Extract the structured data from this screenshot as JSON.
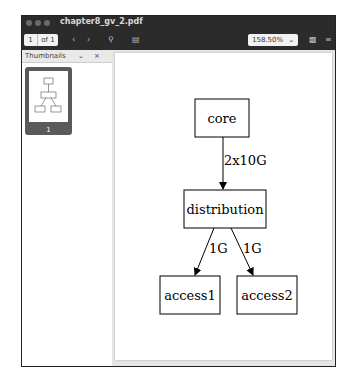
{
  "window": {
    "title": "chapter8_gv_2.pdf"
  },
  "toolbar": {
    "page_current": "1",
    "page_of": "of 1",
    "prev_icon": "chevron-left-icon",
    "next_icon": "chevron-right-icon",
    "search_icon": "search-icon",
    "annotate_icon": "document-icon",
    "zoom_level": "158.50%",
    "zoom_icon": "chevron-down-icon",
    "save_icon": "save-icon",
    "menu_icon": "hamburger-menu-icon"
  },
  "sidebar": {
    "title": "Thumbnails",
    "thumbnail_page": "1"
  },
  "diagram": {
    "nodes": [
      {
        "id": "core",
        "label": "core"
      },
      {
        "id": "distribution",
        "label": "distribution"
      },
      {
        "id": "access1",
        "label": "access1"
      },
      {
        "id": "access2",
        "label": "access2"
      }
    ],
    "edges": [
      {
        "from": "core",
        "to": "distribution",
        "label": "2x10G"
      },
      {
        "from": "distribution",
        "to": "access1",
        "label": "1G"
      },
      {
        "from": "distribution",
        "to": "access2",
        "label": "1G"
      }
    ]
  }
}
